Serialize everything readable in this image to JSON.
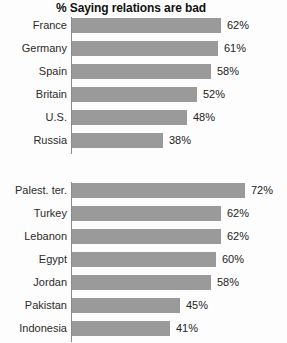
{
  "chart_data": {
    "type": "bar",
    "title": "% Saying relations are bad",
    "orientation": "horizontal",
    "xlabel": "",
    "ylabel": "",
    "xlim": [
      0,
      100
    ],
    "grid": false,
    "legend": "none",
    "value_suffix": "%",
    "bar_color": "#9a9a9a",
    "axis_color": "#8a8a8a",
    "groups": [
      {
        "name": "Western publics",
        "categories": [
          "France",
          "Germany",
          "Spain",
          "Britain",
          "U.S.",
          "Russia"
        ],
        "values": [
          62,
          61,
          58,
          52,
          48,
          38
        ],
        "labels": [
          "62%",
          "61%",
          "58%",
          "52%",
          "48%",
          "38%"
        ]
      },
      {
        "name": "Muslim publics",
        "categories": [
          "Palest. ter.",
          "Turkey",
          "Lebanon",
          "Egypt",
          "Jordan",
          "Pakistan",
          "Indonesia"
        ],
        "values": [
          72,
          62,
          62,
          60,
          58,
          45,
          41
        ],
        "labels": [
          "72%",
          "62%",
          "62%",
          "60%",
          "58%",
          "45%",
          "41%"
        ]
      }
    ]
  }
}
